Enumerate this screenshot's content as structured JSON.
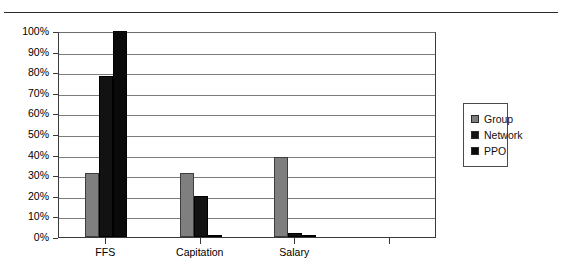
{
  "page": {
    "background_color": "#ffffff",
    "top_rule_color": "#2b2b2b"
  },
  "chart_data": {
    "type": "bar",
    "title": "",
    "subtitle": "",
    "xlabel": "",
    "ylabel": "",
    "categories": [
      "FFS",
      "Capitation",
      "Salary",
      ""
    ],
    "series": [
      {
        "name": "Group",
        "color": "#7f7f7f",
        "values": [
          31,
          31,
          39,
          null
        ]
      },
      {
        "name": "Network",
        "color": "#121212",
        "values": [
          78,
          20,
          2,
          null
        ]
      },
      {
        "name": "PPO",
        "color": "#0a0a0a",
        "values": [
          100,
          1,
          1,
          null
        ]
      }
    ],
    "ylim": [
      0,
      100
    ],
    "ytick_values": [
      0,
      10,
      20,
      30,
      40,
      50,
      60,
      70,
      80,
      90,
      100
    ],
    "ytick_labels": [
      "0%",
      "10%",
      "20%",
      "30%",
      "40%",
      "50%",
      "60%",
      "70%",
      "80%",
      "90%",
      "100%"
    ],
    "grid": true,
    "grid_axis": "y",
    "legend_position": "right",
    "legend_entries": [
      "Group",
      "Network",
      "PPO"
    ]
  },
  "legend": {
    "items": [
      {
        "label": "Group"
      },
      {
        "label": "Network"
      },
      {
        "label": "PPO"
      }
    ]
  }
}
